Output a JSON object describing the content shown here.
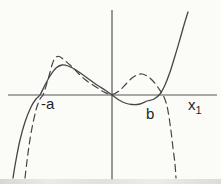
{
  "figure": {
    "background": "#fbfbf8",
    "line_color": "#454545",
    "axis_color": "#565656"
  },
  "chart_data": {
    "type": "line",
    "title": "",
    "grid": false,
    "legend": "none",
    "axis_ticks": "none",
    "labels": {
      "neg_a": "-a",
      "b": "b",
      "x_var": "x",
      "x_sub": "1"
    },
    "x_axis_roots_labeled": [
      "-a",
      "b"
    ],
    "axes_px": {
      "x_axis": {
        "y": 95,
        "x1": 8,
        "x2": 217
      },
      "y_axis": {
        "x": 112,
        "y1": 10,
        "y2": 180
      }
    },
    "series": [
      {
        "name": "solid cubic-like curve",
        "style": "solid",
        "color": "#454545",
        "stroke_width": 1.3,
        "dash": null,
        "shape_summary": "rises from lower left, crosses axis at -a, local max, passes through origin, shallow local min below axis, crosses at b, rises steeply",
        "points_px": [
          [
            13,
            178
          ],
          [
            16,
            160
          ],
          [
            20,
            140
          ],
          [
            25,
            122
          ],
          [
            31,
            107
          ],
          [
            36,
            99
          ],
          [
            40,
            95
          ],
          [
            45,
            85
          ],
          [
            50,
            76
          ],
          [
            56,
            68
          ],
          [
            62,
            65
          ],
          [
            68,
            66
          ],
          [
            76,
            70
          ],
          [
            86,
            77
          ],
          [
            97,
            85
          ],
          [
            105,
            90
          ],
          [
            112,
            95
          ],
          [
            119,
            100
          ],
          [
            125,
            103
          ],
          [
            132,
            104.5
          ],
          [
            140,
            104
          ],
          [
            147,
            101
          ],
          [
            154,
            99
          ],
          [
            160,
            94
          ],
          [
            165,
            85
          ],
          [
            170,
            72
          ],
          [
            175,
            56
          ],
          [
            180,
            39
          ],
          [
            184,
            25
          ],
          [
            188,
            12
          ]
        ]
      },
      {
        "name": "dashed quartic-like curve",
        "style": "dashed",
        "color": "#454545",
        "stroke_width": 1.2,
        "dash": [
          7,
          4.5
        ],
        "shape_summary": "rises from lower left, crosses axis near -a, higher local max, dips to touch axis at origin, small bump above axis, crosses near b, plunges steeply",
        "points_px": [
          [
            25,
            178
          ],
          [
            27,
            161
          ],
          [
            29,
            146
          ],
          [
            32,
            128
          ],
          [
            36,
            110
          ],
          [
            40,
            99
          ],
          [
            43,
            95
          ],
          [
            46,
            86
          ],
          [
            49,
            76
          ],
          [
            52,
            65
          ],
          [
            55,
            58
          ],
          [
            59,
            56.5
          ],
          [
            63,
            59
          ],
          [
            70,
            65
          ],
          [
            78,
            73
          ],
          [
            87,
            81
          ],
          [
            96,
            87
          ],
          [
            104,
            92
          ],
          [
            112,
            94.5
          ],
          [
            119,
            91
          ],
          [
            126,
            84
          ],
          [
            132,
            78
          ],
          [
            137,
            75
          ],
          [
            142,
            74
          ],
          [
            147,
            76
          ],
          [
            152,
            80
          ],
          [
            157,
            86
          ],
          [
            161,
            92
          ],
          [
            164,
            97
          ],
          [
            167,
            106
          ],
          [
            169,
            117
          ],
          [
            171,
            131
          ],
          [
            173,
            148
          ],
          [
            175,
            164
          ],
          [
            176,
            178
          ]
        ]
      }
    ]
  }
}
